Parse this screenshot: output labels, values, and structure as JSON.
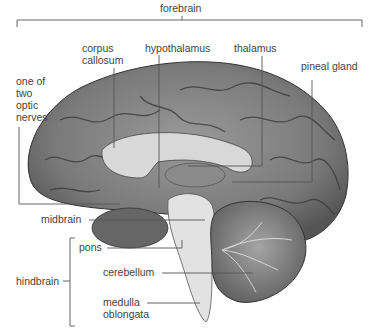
{
  "labels": {
    "forebrain": "forebrain",
    "corpus_callosum_1": "corpus",
    "corpus_callosum_2": "callosum",
    "hypothalamus": "hypothalamus",
    "thalamus": "thalamus",
    "pineal_gland": "pineal gland",
    "optic_1": "one of",
    "optic_2": "two",
    "optic_3": "optic",
    "optic_4": "nerves",
    "midbrain": "midbrain",
    "pons": "pons",
    "hindbrain": "hindbrain",
    "cerebellum": "cerebellum",
    "medulla_1": "medulla",
    "medulla_2": "oblongata"
  },
  "colors": {
    "line": "#555555",
    "text": "#444444"
  }
}
